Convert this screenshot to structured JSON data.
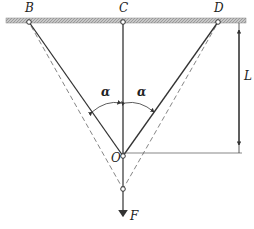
{
  "diagram": {
    "type": "mechanics-truss",
    "labels": {
      "B": "B",
      "C": "C",
      "D": "D",
      "O": "O",
      "F": "F",
      "L": "L",
      "alpha_left": "α",
      "alpha_right": "α"
    },
    "colors": {
      "line": "#333333",
      "beam_fill": "#bdbdbd",
      "dashed": "#777777"
    }
  }
}
